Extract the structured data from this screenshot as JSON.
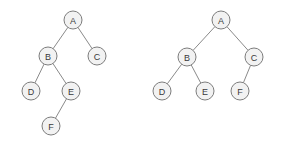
{
  "figure": {
    "background_color": "#ffffff",
    "node_fill": "#f2f2f2",
    "node_stroke": "#7d7d7d",
    "edge_color": "#8a8a8a",
    "label_color": "#3a3a3a",
    "node_radius": 9
  },
  "trees": [
    {
      "id": "left-tree",
      "name": "left-binary-tree",
      "nodes": [
        {
          "id": "L-A",
          "label": "A",
          "x": 73,
          "y": 20
        },
        {
          "id": "L-B",
          "label": "B",
          "x": 48,
          "y": 56
        },
        {
          "id": "L-C",
          "label": "C",
          "x": 97,
          "y": 56
        },
        {
          "id": "L-D",
          "label": "D",
          "x": 31,
          "y": 91
        },
        {
          "id": "L-E",
          "label": "E",
          "x": 71,
          "y": 91
        },
        {
          "id": "L-F",
          "label": "F",
          "x": 51,
          "y": 126
        }
      ],
      "edges": [
        {
          "from": "L-A",
          "to": "L-B"
        },
        {
          "from": "L-A",
          "to": "L-C"
        },
        {
          "from": "L-B",
          "to": "L-D"
        },
        {
          "from": "L-B",
          "to": "L-E"
        },
        {
          "from": "L-E",
          "to": "L-F"
        }
      ]
    },
    {
      "id": "right-tree",
      "name": "right-binary-tree",
      "nodes": [
        {
          "id": "R-A",
          "label": "A",
          "x": 221,
          "y": 20
        },
        {
          "id": "R-B",
          "label": "B",
          "x": 187,
          "y": 57
        },
        {
          "id": "R-C",
          "label": "C",
          "x": 254,
          "y": 57
        },
        {
          "id": "R-D",
          "label": "D",
          "x": 162,
          "y": 91
        },
        {
          "id": "R-E",
          "label": "E",
          "x": 205,
          "y": 91
        },
        {
          "id": "R-F",
          "label": "F",
          "x": 240,
          "y": 91
        }
      ],
      "edges": [
        {
          "from": "R-A",
          "to": "R-B"
        },
        {
          "from": "R-A",
          "to": "R-C"
        },
        {
          "from": "R-B",
          "to": "R-D"
        },
        {
          "from": "R-B",
          "to": "R-E"
        },
        {
          "from": "R-C",
          "to": "R-F"
        }
      ]
    }
  ]
}
